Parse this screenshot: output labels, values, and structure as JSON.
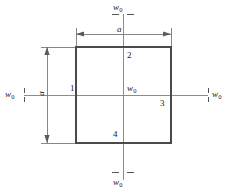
{
  "figure": {
    "type": "engineering-diagram",
    "colors": {
      "plate_outline": "#4a4a4a",
      "axis_line": "#8c8c8c",
      "dimension_line": "#7a7a7a",
      "text": "#1a1a1a",
      "background": "#ffffff"
    },
    "geometry": {
      "square": {
        "x": 76,
        "y": 47,
        "width": 95,
        "height": 96
      },
      "h_axis_y": 95,
      "v_axis_x": 123,
      "h_axis_x1": 24,
      "h_axis_x2": 208,
      "v_axis_y1": 14,
      "v_axis_y2": 180,
      "top_dim_y": 34,
      "left_dim_x": 47
    }
  },
  "loads": {
    "symbol": "w",
    "subscript": "0",
    "top": {
      "symbol": "w",
      "subscript": "0"
    },
    "bottom": {
      "symbol": "w",
      "subscript": "0"
    },
    "left": {
      "symbol": "w",
      "subscript": "0"
    },
    "right": {
      "symbol": "w",
      "subscript": "0"
    },
    "center": {
      "symbol": "w",
      "subscript": "0"
    }
  },
  "dimensions": {
    "horizontal": {
      "label": "a"
    },
    "vertical": {
      "label": "a"
    }
  },
  "nodes": [
    {
      "id": "1",
      "label": "1",
      "x": 70,
      "y": 88,
      "position": "left-edge"
    },
    {
      "id": "2",
      "label": "2",
      "x": 127,
      "y": 52,
      "position": "top-edge"
    },
    {
      "id": "3",
      "label": "3",
      "x": 160,
      "y": 100,
      "position": "right-edge"
    },
    {
      "id": "4",
      "label": "4",
      "x": 113,
      "y": 131,
      "position": "bottom-edge"
    }
  ]
}
